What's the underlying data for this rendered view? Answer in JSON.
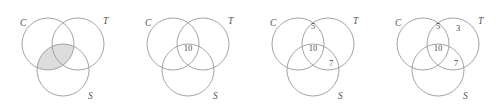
{
  "figure": {
    "kind": "venn-diagram-sequence",
    "panel_count": 4,
    "background_color": "#ffffff",
    "circle_stroke_color": "#9a9a9a",
    "shade_fill_color": "#dcdcdc",
    "label_color": "#555555",
    "number_color": "#4a4a4a",
    "set_labels": {
      "left": "C",
      "right": "T",
      "bottom": "S"
    },
    "geometry": {
      "left_circle": {
        "cx": 48,
        "cy": 44,
        "r": 26
      },
      "right_circle": {
        "cx": 78,
        "cy": 44,
        "r": 26
      },
      "bottom_circle": {
        "cx": 63,
        "cy": 70,
        "r": 26
      },
      "label_positions": {
        "left": {
          "x": 20,
          "y": 26
        },
        "right": {
          "x": 103,
          "y": 24
        },
        "bottom": {
          "x": 88,
          "y": 99
        }
      }
    },
    "panels": [
      {
        "id": "panel-1",
        "offset_x": 0,
        "shaded_region": "C-and-S",
        "shaded": true,
        "numbers": []
      },
      {
        "id": "panel-2",
        "offset_x": 125,
        "shaded_region": "",
        "shaded": false,
        "numbers": [
          {
            "region": "C-and-T-and-S",
            "value": "10",
            "x": 63,
            "y": 51
          }
        ]
      },
      {
        "id": "panel-3",
        "offset_x": 250,
        "shaded_region": "",
        "shaded": false,
        "numbers": [
          {
            "region": "C-and-T-only",
            "value": "5",
            "x": 63,
            "y": 29
          },
          {
            "region": "C-and-T-and-S",
            "value": "10",
            "x": 63,
            "y": 51
          },
          {
            "region": "T-and-S-only",
            "value": "7",
            "x": 81,
            "y": 66
          }
        ]
      },
      {
        "id": "panel-4",
        "offset_x": 375,
        "shaded_region": "",
        "shaded": false,
        "numbers": [
          {
            "region": "C-and-T-only",
            "value": "5",
            "x": 63,
            "y": 29
          },
          {
            "region": "T-only",
            "value": "3",
            "x": 83,
            "y": 31
          },
          {
            "region": "C-and-T-and-S",
            "value": "10",
            "x": 63,
            "y": 51
          },
          {
            "region": "T-and-S-only",
            "value": "7",
            "x": 81,
            "y": 66
          }
        ]
      }
    ]
  }
}
